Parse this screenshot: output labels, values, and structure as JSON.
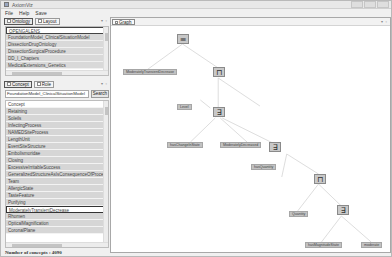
{
  "window": {
    "title": "AxiomViz",
    "menu": [
      "File",
      "Help",
      "Save"
    ]
  },
  "ontology_panel": {
    "tabs": [
      {
        "label": "Ontology",
        "active": true
      },
      {
        "label": "Layout",
        "active": false
      }
    ],
    "items": [
      "OPENGALENS",
      "FoundationModel_ClinicalSituationModel",
      "DissectionDrugOntology",
      "DissectionSurgicalProcedure",
      "DD_I_Chapters",
      "MedicalExtensions_Genetics"
    ],
    "selected_index": 0
  },
  "concept_panel": {
    "tabs": [
      {
        "label": "Concept",
        "active": true
      },
      {
        "label": "Role",
        "active": false
      }
    ],
    "search": {
      "value": "FoundationModel_ClinicalSituationModel",
      "button_label": "Search"
    },
    "header": "Concept",
    "items": [
      "Retaining",
      "Soleils",
      "InfectingProcess",
      "NAMEDSiteProcess",
      "LengthUnit",
      "EventSiteStructure",
      "Embolismoridae",
      "Closing",
      "ExcessiveIrritableSuccess",
      "GeneralizedStructureAsIsConsequenceOfProcess",
      "Team",
      "AllergicState",
      "TasteFeature",
      "Purifying",
      "ModeratelyTransientDecrease",
      "Rhomen",
      "OpticalMagnification",
      "CoronalPlane"
    ],
    "selected_item": "ModeratelyTransientDecrease"
  },
  "status": {
    "text": "Number of concepts : 4090"
  },
  "graph_panel": {
    "tab_label": "Graph",
    "nodes": {
      "root": {
        "symbol": "≡"
      },
      "concept": {
        "label": "ModeratelyTransientDecrease"
      },
      "and1": {
        "symbol": "⊓"
      },
      "label_level": {
        "label": "Level"
      },
      "exists1": {
        "symbol": "∃"
      },
      "label_hasChange": {
        "label": "hasChangeInState"
      },
      "label_undetermined": {
        "label": "ModeratelyDecreased"
      },
      "exists2": {
        "symbol": "∃"
      },
      "label_hasSomething": {
        "label": "hasQuantity"
      },
      "and2": {
        "symbol": "⊓"
      },
      "label_quantity": {
        "label": "Quantity"
      },
      "exists3": {
        "symbol": "∃"
      },
      "label_hasMagnitude": {
        "label": "hasMagnitudeState"
      },
      "label_moderate": {
        "label": "moderate"
      }
    }
  }
}
